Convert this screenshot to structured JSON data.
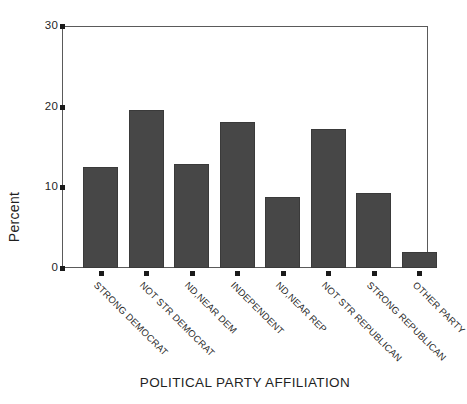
{
  "chart_data": {
    "type": "bar",
    "title": "",
    "xlabel": "POLITICAL PARTY AFFILIATION",
    "ylabel": "Percent",
    "categories": [
      "STRONG DEMOCRAT",
      "NOT STR DEMOCRAT",
      "ND,NEAR DEM",
      "INDEPENDENT",
      "ND,NEAR REP",
      "NOT STR REPUBLICAN",
      "STRONG REPUBLICAN",
      "OTHER PARTY"
    ],
    "values": [
      12.5,
      19.6,
      12.9,
      18.1,
      8.8,
      17.2,
      9.3,
      2.0
    ],
    "ylim": [
      0,
      30
    ],
    "yticks": [
      0,
      10,
      20,
      30
    ],
    "ytick_labels": [
      "0",
      "10",
      "20",
      "30"
    ],
    "grid": false,
    "legend": null,
    "bar_color": "#474747",
    "frame_color": "#5a5a5a",
    "axis_text_color": "#1f1f1f"
  }
}
